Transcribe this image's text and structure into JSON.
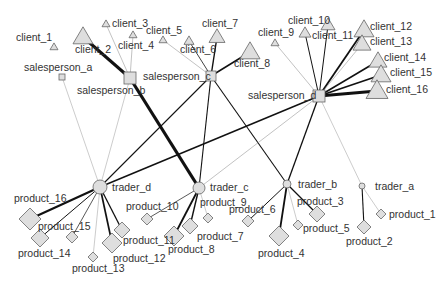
{
  "diagram": {
    "type": "network",
    "node_fill": "#dedede",
    "node_stroke": "#666666",
    "edge_color": "#111111",
    "nodes": [
      {
        "id": "client_1",
        "shape": "triangle",
        "x": 54,
        "y": 47,
        "size": 4,
        "lx": 16,
        "ly": 41,
        "anchor": "start"
      },
      {
        "id": "client_2",
        "shape": "triangle",
        "x": 83,
        "y": 37,
        "size": 10,
        "lx": 75,
        "ly": 53,
        "anchor": "start"
      },
      {
        "id": "client_3",
        "shape": "triangle",
        "x": 106,
        "y": 24,
        "size": 4,
        "lx": 112,
        "ly": 27,
        "anchor": "start"
      },
      {
        "id": "client_4",
        "shape": "triangle",
        "x": 133,
        "y": 35,
        "size": 4,
        "lx": 118,
        "ly": 49,
        "anchor": "start"
      },
      {
        "id": "client_5",
        "shape": "triangle",
        "x": 163,
        "y": 40,
        "size": 4,
        "lx": 146,
        "ly": 34,
        "anchor": "start"
      },
      {
        "id": "client_6",
        "shape": "triangle",
        "x": 189,
        "y": 41,
        "size": 5,
        "lx": 180,
        "ly": 53,
        "anchor": "start"
      },
      {
        "id": "client_7",
        "shape": "triangle",
        "x": 217,
        "y": 37,
        "size": 8,
        "lx": 202,
        "ly": 27,
        "anchor": "start"
      },
      {
        "id": "client_8",
        "shape": "triangle",
        "x": 250,
        "y": 52,
        "size": 10,
        "lx": 234,
        "ly": 67,
        "anchor": "start"
      },
      {
        "id": "client_9",
        "shape": "triangle",
        "x": 275,
        "y": 43,
        "size": 4,
        "lx": 258,
        "ly": 36,
        "anchor": "start"
      },
      {
        "id": "client_10",
        "shape": "triangle",
        "x": 328,
        "y": 25,
        "size": 7,
        "lx": 288,
        "ly": 24,
        "anchor": "start"
      },
      {
        "id": "client_11",
        "shape": "triangle",
        "x": 305,
        "y": 33,
        "size": 6,
        "lx": 312,
        "ly": 39,
        "anchor": "start"
      },
      {
        "id": "client_12",
        "shape": "triangle",
        "x": 364,
        "y": 30,
        "size": 10,
        "lx": 370,
        "ly": 30,
        "anchor": "start"
      },
      {
        "id": "client_13",
        "shape": "triangle",
        "x": 362,
        "y": 44,
        "size": 9,
        "lx": 370,
        "ly": 45,
        "anchor": "start"
      },
      {
        "id": "client_14",
        "shape": "triangle",
        "x": 378,
        "y": 61,
        "size": 9,
        "lx": 384,
        "ly": 61,
        "anchor": "start"
      },
      {
        "id": "client_15",
        "shape": "triangle",
        "x": 381,
        "y": 75,
        "size": 10,
        "lx": 390,
        "ly": 76,
        "anchor": "start"
      },
      {
        "id": "client_16",
        "shape": "triangle",
        "x": 377,
        "y": 91,
        "size": 11,
        "lx": 386,
        "ly": 93,
        "anchor": "start"
      },
      {
        "id": "salesperson_a",
        "shape": "square",
        "x": 62,
        "y": 77,
        "size": 3,
        "lx": 24,
        "ly": 71,
        "anchor": "start"
      },
      {
        "id": "salesperson_b",
        "shape": "square",
        "x": 130,
        "y": 78,
        "size": 6,
        "lx": 77,
        "ly": 94,
        "anchor": "start"
      },
      {
        "id": "salesperson_c",
        "shape": "square",
        "x": 211,
        "y": 76,
        "size": 5,
        "lx": 143,
        "ly": 80,
        "anchor": "start"
      },
      {
        "id": "salesperson_d",
        "shape": "square",
        "x": 319,
        "y": 96,
        "size": 6,
        "lx": 248,
        "ly": 99,
        "anchor": "start"
      },
      {
        "id": "trader_a",
        "shape": "circle",
        "x": 362,
        "y": 186,
        "size": 3,
        "lx": 375,
        "ly": 190,
        "anchor": "start"
      },
      {
        "id": "trader_b",
        "shape": "circle",
        "x": 287,
        "y": 184,
        "size": 4,
        "lx": 298,
        "ly": 188,
        "anchor": "start"
      },
      {
        "id": "trader_c",
        "shape": "circle",
        "x": 199,
        "y": 188,
        "size": 6,
        "lx": 210,
        "ly": 191,
        "anchor": "start"
      },
      {
        "id": "trader_d",
        "shape": "circle",
        "x": 100,
        "y": 187,
        "size": 7,
        "lx": 112,
        "ly": 191,
        "anchor": "start"
      },
      {
        "id": "product_1",
        "shape": "diamond",
        "x": 381,
        "y": 214,
        "size": 5,
        "lx": 389,
        "ly": 218,
        "anchor": "start"
      },
      {
        "id": "product_2",
        "shape": "diamond",
        "x": 364,
        "y": 227,
        "size": 7,
        "lx": 346,
        "ly": 245,
        "anchor": "start"
      },
      {
        "id": "product_3",
        "shape": "diamond",
        "x": 317,
        "y": 214,
        "size": 8,
        "lx": 297,
        "ly": 205,
        "anchor": "start"
      },
      {
        "id": "product_4",
        "shape": "diamond",
        "x": 279,
        "y": 236,
        "size": 10,
        "lx": 258,
        "ly": 257,
        "anchor": "start"
      },
      {
        "id": "product_5",
        "shape": "diamond",
        "x": 298,
        "y": 225,
        "size": 5,
        "lx": 303,
        "ly": 232,
        "anchor": "start"
      },
      {
        "id": "product_6",
        "shape": "diamond",
        "x": 248,
        "y": 221,
        "size": 6,
        "lx": 229,
        "ly": 213,
        "anchor": "start"
      },
      {
        "id": "product_7",
        "shape": "diamond",
        "x": 190,
        "y": 226,
        "size": 8,
        "lx": 197,
        "ly": 240,
        "anchor": "start"
      },
      {
        "id": "product_8",
        "shape": "diamond",
        "x": 174,
        "y": 236,
        "size": 10,
        "lx": 168,
        "ly": 253,
        "anchor": "start"
      },
      {
        "id": "product_9",
        "shape": "diamond",
        "x": 208,
        "y": 218,
        "size": 5,
        "lx": 200,
        "ly": 206,
        "anchor": "start"
      },
      {
        "id": "product_10",
        "shape": "diamond",
        "x": 147,
        "y": 219,
        "size": 6,
        "lx": 126,
        "ly": 210,
        "anchor": "start"
      },
      {
        "id": "product_11",
        "shape": "diamond",
        "x": 122,
        "y": 230,
        "size": 8,
        "lx": 123,
        "ly": 244,
        "anchor": "start"
      },
      {
        "id": "product_12",
        "shape": "diamond",
        "x": 112,
        "y": 243,
        "size": 10,
        "lx": 113,
        "ly": 262,
        "anchor": "start"
      },
      {
        "id": "product_13",
        "shape": "diamond",
        "x": 93,
        "y": 257,
        "size": 5,
        "lx": 72,
        "ly": 272,
        "anchor": "start"
      },
      {
        "id": "product_14",
        "shape": "diamond",
        "x": 40,
        "y": 238,
        "size": 9,
        "lx": 18,
        "ly": 257,
        "anchor": "start"
      },
      {
        "id": "product_15",
        "shape": "diamond",
        "x": 72,
        "y": 237,
        "size": 6,
        "lx": 38,
        "ly": 230,
        "anchor": "start"
      },
      {
        "id": "product_16",
        "shape": "diamond",
        "x": 30,
        "y": 219,
        "size": 11,
        "lx": 14,
        "ly": 202,
        "anchor": "start"
      }
    ],
    "edges": [
      {
        "from": "client_2",
        "to": "salesperson_b",
        "w": 3
      },
      {
        "from": "client_3",
        "to": "salesperson_b",
        "w": 0.6
      },
      {
        "from": "client_4",
        "to": "salesperson_b",
        "w": 0.6
      },
      {
        "from": "client_5",
        "to": "salesperson_c",
        "w": 0.6
      },
      {
        "from": "client_6",
        "to": "salesperson_c",
        "w": 0.8
      },
      {
        "from": "client_7",
        "to": "salesperson_c",
        "w": 1.4
      },
      {
        "from": "client_8",
        "to": "salesperson_c",
        "w": 1.6
      },
      {
        "from": "client_9",
        "to": "salesperson_d",
        "w": 0.6
      },
      {
        "from": "client_10",
        "to": "salesperson_d",
        "w": 1.0
      },
      {
        "from": "client_11",
        "to": "salesperson_d",
        "w": 1.0
      },
      {
        "from": "client_12",
        "to": "salesperson_d",
        "w": 1.8
      },
      {
        "from": "client_13",
        "to": "salesperson_d",
        "w": 0.6
      },
      {
        "from": "client_14",
        "to": "salesperson_d",
        "w": 1.6
      },
      {
        "from": "client_15",
        "to": "salesperson_d",
        "w": 1.8
      },
      {
        "from": "client_16",
        "to": "salesperson_d",
        "w": 3
      },
      {
        "from": "salesperson_a",
        "to": "trader_d",
        "w": 0.5
      },
      {
        "from": "salesperson_b",
        "to": "trader_d",
        "w": 0.5
      },
      {
        "from": "salesperson_b",
        "to": "trader_c",
        "w": 3.2
      },
      {
        "from": "salesperson_c",
        "to": "trader_d",
        "w": 1.1
      },
      {
        "from": "salesperson_c",
        "to": "trader_c",
        "w": 1.1
      },
      {
        "from": "salesperson_c",
        "to": "trader_b",
        "w": 1.1
      },
      {
        "from": "salesperson_d",
        "to": "trader_d",
        "w": 1.5
      },
      {
        "from": "salesperson_d",
        "to": "trader_c",
        "w": 0.6
      },
      {
        "from": "salesperson_d",
        "to": "trader_b",
        "w": 1.3
      },
      {
        "from": "salesperson_d",
        "to": "trader_a",
        "w": 0.5
      },
      {
        "from": "trader_a",
        "to": "product_1",
        "w": 0.5
      },
      {
        "from": "trader_a",
        "to": "product_2",
        "w": 1.1
      },
      {
        "from": "trader_b",
        "to": "product_3",
        "w": 1.2
      },
      {
        "from": "trader_b",
        "to": "product_4",
        "w": 1.8
      },
      {
        "from": "trader_b",
        "to": "product_5",
        "w": 0.5
      },
      {
        "from": "trader_b",
        "to": "product_6",
        "w": 1.0
      },
      {
        "from": "trader_c",
        "to": "product_7",
        "w": 1.4
      },
      {
        "from": "trader_c",
        "to": "product_8",
        "w": 1.8
      },
      {
        "from": "trader_c",
        "to": "product_9",
        "w": 0.5
      },
      {
        "from": "trader_c",
        "to": "product_10",
        "w": 0.7
      },
      {
        "from": "trader_d",
        "to": "product_11",
        "w": 1.3
      },
      {
        "from": "trader_d",
        "to": "product_12",
        "w": 1.7
      },
      {
        "from": "trader_d",
        "to": "product_13",
        "w": 0.5
      },
      {
        "from": "trader_d",
        "to": "product_14",
        "w": 1.0
      },
      {
        "from": "trader_d",
        "to": "product_15",
        "w": 0.7
      },
      {
        "from": "trader_d",
        "to": "product_16",
        "w": 2.0
      }
    ]
  }
}
